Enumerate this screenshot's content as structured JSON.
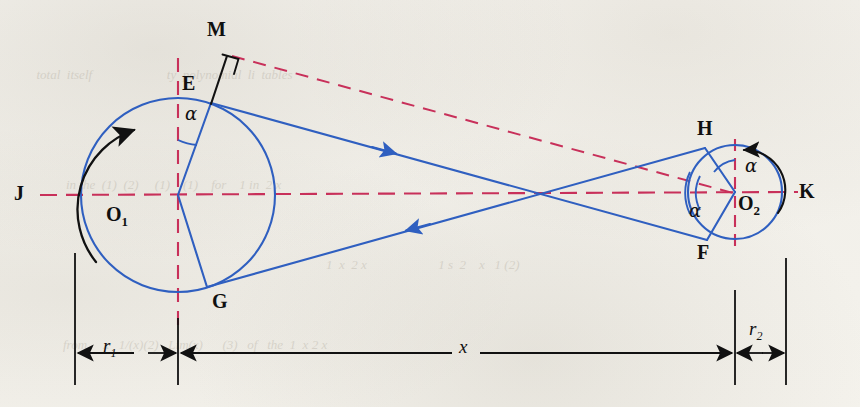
{
  "figure": {
    "kind": "engineering-diagram",
    "background_color": "#f4f2ed",
    "colors": {
      "pulley_and_belt": "#2f5fc0",
      "centerline": "#c8305a",
      "construction": "#111111"
    }
  },
  "points": {
    "J": "J",
    "K": "K",
    "M": "M",
    "E": "E",
    "G": "G",
    "H": "H",
    "F": "F",
    "O1": "O",
    "O1_sub": "1",
    "O2": "O",
    "O2_sub": "2"
  },
  "angles": {
    "alpha": "α",
    "alpha_at_E": "α",
    "alpha_at_O2_upper": "α",
    "alpha_at_O2_lower": "α"
  },
  "dimensions": {
    "r1": "r",
    "r1_sub": "1",
    "r2": "r",
    "r2_sub": "2",
    "x": "x"
  },
  "geometry": {
    "pulley1": {
      "cx": 178,
      "cy": 195,
      "r": 97
    },
    "pulley2": {
      "cx": 735,
      "cy": 192,
      "r": 47
    },
    "belt_crossing": {
      "x": 545,
      "y": 194
    },
    "tangent_points": {
      "E": {
        "x": 211,
        "y": 103
      },
      "G": {
        "x": 207,
        "y": 287
      },
      "H": {
        "x": 705,
        "y": 148
      },
      "F": {
        "x": 707,
        "y": 240
      }
    },
    "perpendicular_point_M": {
      "x": 226,
      "y": 52
    },
    "dimension_line_y": 353,
    "r1_span": {
      "from": 75,
      "to": 178
    },
    "x_span": {
      "from": 178,
      "to": 735
    },
    "r2_span": {
      "from": 735,
      "to": 786
    }
  },
  "ghost_text": {
    "line1": "  total  itself                       ty  polynomial  li  tables",
    "line2": "        in the  (1)  (2)     (1)    (1)    for    1 in  2 x",
    "line3": "    from     x   1/(x)(2)   Lim(x)      (3)   of   the  1  x 2 x",
    "line4": "        1  x  2 x                      1 s  2    x   1 (2)"
  }
}
